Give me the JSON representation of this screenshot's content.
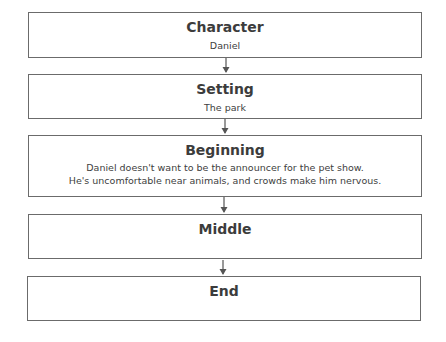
{
  "diagram": {
    "type": "story-map-flowchart",
    "boxes": [
      {
        "title": "Character",
        "text": "Daniel"
      },
      {
        "title": "Setting",
        "text": "The park"
      },
      {
        "title": "Beginning",
        "text_lines": [
          "Daniel doesn't want to be the announcer for the pet show.",
          "He's uncomfortable near animals, and crowds make him nervous."
        ]
      },
      {
        "title": "Middle",
        "text": ""
      },
      {
        "title": "End",
        "text": ""
      }
    ],
    "connectors": [
      {
        "from": "Character",
        "to": "Setting"
      },
      {
        "from": "Setting",
        "to": "Beginning"
      },
      {
        "from": "Beginning",
        "to": "Middle"
      },
      {
        "from": "Middle",
        "to": "End"
      }
    ],
    "colors": {
      "border": "#6b6b6b",
      "text": "#3c3c3c",
      "background": "#ffffff"
    }
  }
}
